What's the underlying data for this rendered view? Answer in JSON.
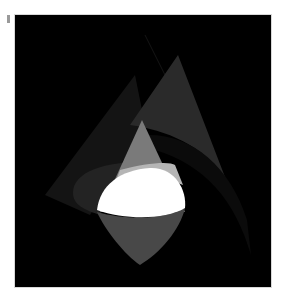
{
  "artwork": {
    "description": "Abstract composition: glowing white teardrop lens with grey cone and translucent dark wedges on black",
    "background_color": "#000000",
    "frame_color": "#ffffff",
    "colors": {
      "white_lens": "#ffffff",
      "lower_drop": "#4a4a4a",
      "grey_cone": "#7a7a7a",
      "light_band": "#b8b8b8",
      "dark_wedge_right": "#2b2b2b",
      "dark_wedge_left": "#1a1a1a",
      "left_ellipse": "#262626"
    },
    "shapes": [
      "tall-dark-cone-right",
      "faint-wedge-left",
      "left-ellipse-arc",
      "grey-cone-center",
      "light-band",
      "white-lens",
      "lower-drop"
    ]
  },
  "marks": {
    "corner_tick": "grey tick mark top-left"
  }
}
